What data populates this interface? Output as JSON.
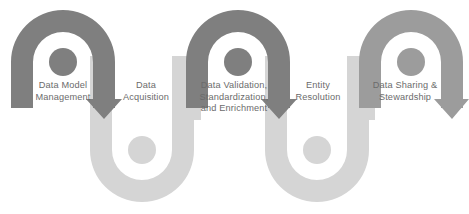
{
  "diagram": {
    "type": "serpentine-process-flow",
    "background_color": "#ffffff",
    "colors": {
      "dark_gray": "#7f7f7f",
      "medium_gray": "#9c9c9c",
      "light_gray": "#d5d5d5",
      "label_text": "#6b6b6b"
    },
    "stages": [
      {
        "id": "data-model-management",
        "label": "Data Model\nManagement",
        "order": 1,
        "shape": "arch-down",
        "color": "#7f7f7f"
      },
      {
        "id": "data-acquisition",
        "label": "Data\nAcquisition",
        "order": 2,
        "shape": "u-up",
        "color": "#d5d5d5"
      },
      {
        "id": "data-validation-standardization-enrichment",
        "label": "Data Validation,\nStandardization,\nand Enrichment",
        "order": 3,
        "shape": "arch-down",
        "color": "#7f7f7f"
      },
      {
        "id": "entity-resolution",
        "label": "Entity\nResolution",
        "order": 4,
        "shape": "u-up",
        "color": "#d5d5d5"
      },
      {
        "id": "data-sharing-stewardship",
        "label": "Data Sharing &\nStewardship",
        "order": 5,
        "shape": "arch-down",
        "color": "#9c9c9c"
      }
    ],
    "arrows": [
      {
        "id": "arrow-1",
        "direction": "down",
        "color": "#7f7f7f"
      },
      {
        "id": "arrow-2",
        "direction": "up",
        "color": "#d5d5d5"
      },
      {
        "id": "arrow-3",
        "direction": "down",
        "color": "#7f7f7f"
      },
      {
        "id": "arrow-4",
        "direction": "up",
        "color": "#d5d5d5"
      },
      {
        "id": "arrow-5",
        "direction": "down",
        "color": "#9c9c9c"
      }
    ]
  }
}
